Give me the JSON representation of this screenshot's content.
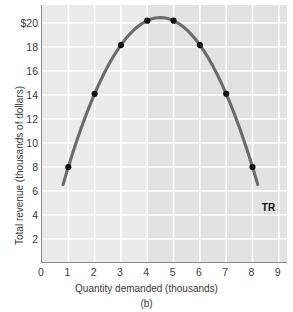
{
  "chart_data": {
    "type": "line",
    "title": "",
    "subtitle": "",
    "panel_label": "(b)",
    "xlabel": "Quantity demanded (thousands)",
    "ylabel": "Total revenue (thousands of dollars)",
    "series_label": "TR",
    "x": [
      1,
      2,
      3,
      4,
      5,
      6,
      7,
      8
    ],
    "values": [
      8,
      14,
      18,
      20,
      20,
      18,
      14,
      8
    ],
    "series": [
      {
        "name": "TR",
        "x": [
          1,
          2,
          3,
          4,
          5,
          6,
          7,
          8
        ],
        "values": [
          8,
          14,
          18,
          20,
          20,
          18,
          14,
          8
        ]
      }
    ],
    "curve_endpoints": {
      "left": {
        "x": 0.8,
        "y": 5
      },
      "right": {
        "x": 8.2,
        "y": 5
      }
    },
    "xlim": [
      0,
      9.35
    ],
    "ylim": [
      0,
      21.5
    ],
    "xticks": [
      0,
      1,
      2,
      3,
      4,
      5,
      6,
      7,
      8,
      9
    ],
    "xtick_labels": [
      "0",
      "1",
      "2",
      "3",
      "4",
      "5",
      "6",
      "7",
      "8",
      "9"
    ],
    "yticks": [
      2,
      4,
      6,
      8,
      10,
      12,
      14,
      16,
      18,
      20
    ],
    "ytick_labels": [
      "2",
      "4",
      "6",
      "8",
      "10",
      "12",
      "14",
      "16",
      "18",
      "$20"
    ],
    "grid": true,
    "grid_color": "#ffffff",
    "plot_background": "#ebebeb",
    "shaded_band_color": "#e2e2e2",
    "shaded_band_x": [
      4,
      9.35
    ],
    "legend": "none",
    "line_color": "#6b6b6b",
    "marker_color": "#111111",
    "axis_color": "#8a8a8a"
  }
}
